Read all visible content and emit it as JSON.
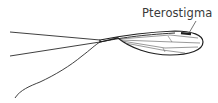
{
  "diagram": {
    "labels": [
      {
        "text": "Pterostigma",
        "target": "pterostigma"
      }
    ],
    "colors": {
      "stroke": "#2a2a2a",
      "vein": "#555555",
      "label": "#3a3a3a",
      "background": "#ffffff"
    }
  }
}
